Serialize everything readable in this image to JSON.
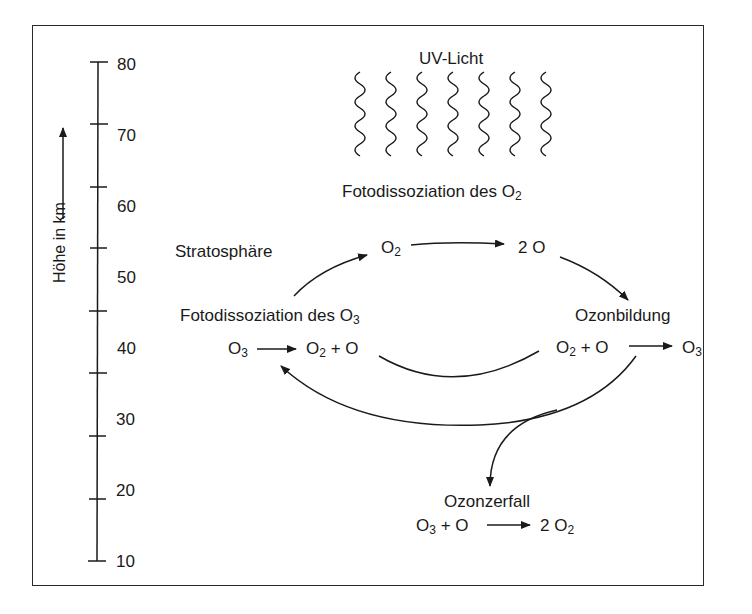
{
  "axis": {
    "label": "Höhe in km",
    "ticks": [
      "80",
      "70",
      "60",
      "50",
      "40",
      "30",
      "20",
      "10"
    ]
  },
  "uv": {
    "label": "UV-Licht",
    "wave_count": 7
  },
  "o2_photodissociation": {
    "title_prefix": "Fotodissoziation des O",
    "title_sub": "2"
  },
  "region": {
    "label": "Stratosphäre"
  },
  "cycle_top": {
    "left_prefix": "O",
    "left_sub": "2",
    "right": "2 O"
  },
  "o3_photodissociation": {
    "title_prefix": "Fotodissoziation des O",
    "title_sub": "3",
    "reactant_prefix": "O",
    "reactant_sub": "3",
    "product_a_prefix": "O",
    "product_a_sub": "2",
    "product_b": "+ O"
  },
  "ozone_formation": {
    "title": "Ozonbildung",
    "reactant_a_prefix": "O",
    "reactant_a_sub": "2",
    "reactant_b": "+ O",
    "product_prefix": "O",
    "product_sub": "3"
  },
  "ozone_decay": {
    "title": "Ozonzerfall",
    "reactant_a_prefix": "O",
    "reactant_a_sub": "3",
    "reactant_b": "+ O",
    "product_prefix": "2 O",
    "product_sub": "2"
  }
}
